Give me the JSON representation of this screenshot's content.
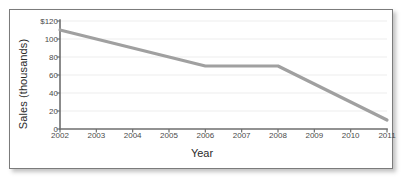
{
  "chart_data": {
    "type": "line",
    "title": "",
    "xlabel": "Year",
    "ylabel": "Sales (thousands)",
    "x": [
      2002,
      2003,
      2004,
      2005,
      2006,
      2007,
      2008,
      2009,
      2010,
      2011
    ],
    "xtick_labels": [
      "2002",
      "2003",
      "2004",
      "2005",
      "2006",
      "2007",
      "2008",
      "2009",
      "2010",
      "2011"
    ],
    "values": [
      110,
      100,
      90,
      80,
      70,
      70,
      70,
      50,
      30,
      10
    ],
    "ytick_values": [
      0,
      20,
      40,
      60,
      80,
      100,
      120
    ],
    "ytick_labels": [
      "0",
      "20",
      "40",
      "60",
      "80",
      "100",
      "$120"
    ],
    "xlim": [
      2002,
      2011
    ],
    "ylim": [
      0,
      120
    ],
    "grid": true,
    "grid_axis": "y",
    "legend": false,
    "series": [
      {
        "name": "Sales",
        "values": [
          110,
          100,
          90,
          80,
          70,
          70,
          70,
          50,
          30,
          10
        ]
      }
    ],
    "colors": {
      "line": "#a0a0a0",
      "axis": "#6e6e6e",
      "grid": "#ededed",
      "text": "#3a3a3a",
      "frame": "#7b7b7b",
      "background": "#ffffff"
    },
    "line_width": 3.2
  }
}
